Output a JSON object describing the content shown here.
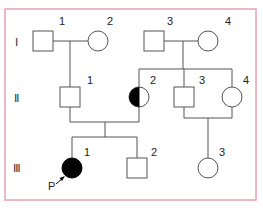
{
  "frame": {
    "border_color": "#e8a0b0"
  },
  "generations": [
    {
      "label": "Ⅰ",
      "key": "I"
    },
    {
      "label": "Ⅱ",
      "key": "II"
    },
    {
      "label": "Ⅲ",
      "key": "III"
    }
  ],
  "individuals": {
    "I1": {
      "number": "1",
      "sex": "male",
      "status": "unaffected"
    },
    "I2": {
      "number": "2",
      "sex": "female",
      "status": "unaffected"
    },
    "I3": {
      "number": "3",
      "sex": "male",
      "status": "unaffected"
    },
    "I4": {
      "number": "4",
      "sex": "female",
      "status": "unaffected"
    },
    "II1": {
      "number": "1",
      "sex": "male",
      "status": "unaffected"
    },
    "II2": {
      "number": "2",
      "sex": "female",
      "status": "carrier (half-filled)"
    },
    "II3": {
      "number": "3",
      "sex": "male",
      "status": "unaffected"
    },
    "II4": {
      "number": "4",
      "sex": "female",
      "status": "unaffected"
    },
    "III1": {
      "number": "1",
      "sex": "female",
      "status": "affected"
    },
    "III2": {
      "number": "2",
      "sex": "male",
      "status": "unaffected"
    },
    "III3": {
      "number": "3",
      "sex": "female",
      "status": "unaffected"
    }
  },
  "proband": {
    "label": "P",
    "individual": "III1"
  },
  "colors": {
    "line": "#555555",
    "affected": "#000000",
    "unaffected_fill": "#ffffff"
  }
}
